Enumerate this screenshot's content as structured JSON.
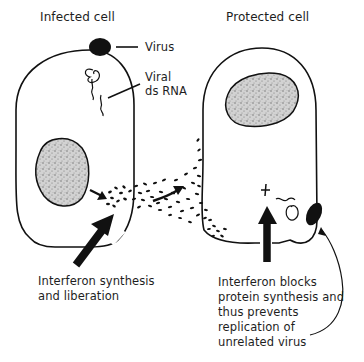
{
  "diagram": {
    "left_cell": {
      "title": "Infected cell",
      "labels": {
        "virus": "Virus",
        "viral_rna_line1": "Viral",
        "viral_rna_line2": "ds RNA"
      },
      "caption_line1": "Interferon synthesis",
      "caption_line2": "and liberation"
    },
    "right_cell": {
      "title": "Protected cell",
      "symbol": "+",
      "caption_line1": "Interferon blocks",
      "caption_line2": "protein synthesis and",
      "caption_line3": "thus prevents",
      "caption_line4": "replication of",
      "caption_line5": "unrelated virus"
    },
    "colors": {
      "ink": "#111111",
      "nucleus_fill": "#c9c9c9",
      "background": "#ffffff"
    }
  }
}
